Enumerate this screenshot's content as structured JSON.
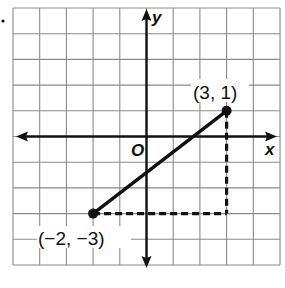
{
  "diagram": {
    "type": "coordinate-plane",
    "grid": {
      "x_min": -5,
      "x_max": 5,
      "y_min": -5,
      "y_max": 5,
      "step": 1
    },
    "axes": {
      "x_label": "x",
      "y_label": "y",
      "origin_label": "O"
    },
    "points": [
      {
        "id": "A",
        "x": 3,
        "y": 1,
        "label": "(3, 1)"
      },
      {
        "id": "B",
        "x": -2,
        "y": -3,
        "label": "(−2, −3)"
      }
    ],
    "segments": [
      {
        "from": "B",
        "to": "A",
        "style": "solid"
      }
    ],
    "dashed_guides": [
      {
        "from": [
          3,
          1
        ],
        "to": [
          3,
          -3
        ],
        "style": "dashed"
      },
      {
        "from": [
          -2,
          -3
        ],
        "to": [
          3,
          -3
        ],
        "style": "dashed"
      }
    ]
  },
  "colors": {
    "grid": "#8a8a8a",
    "ink": "#111111",
    "background": "#ffffff"
  }
}
